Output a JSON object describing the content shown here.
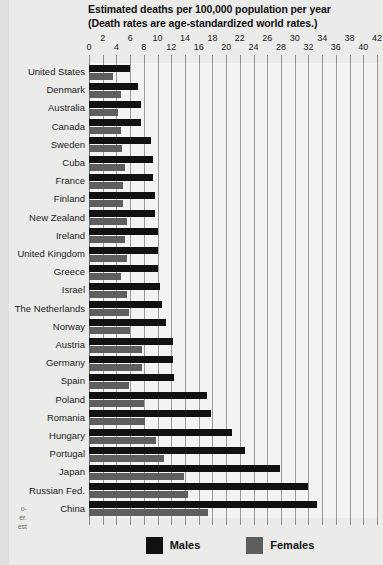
{
  "title": {
    "line1": "Estimated deaths per 100,000 population per year",
    "line2": "(Death rates are age-standardized world rates.)"
  },
  "legend": {
    "males_label": "Males",
    "females_label": "Females",
    "males_color": "#111111",
    "females_color": "#5e5e5e"
  },
  "bleed_text": {
    "l1": "o-",
    "l2": "er.",
    "l3": "est"
  },
  "chart_data": {
    "type": "bar",
    "orientation": "horizontal",
    "title": "Estimated deaths per 100,000 population per year (Death rates are age-standardized world rates.)",
    "xlabel": "",
    "ylabel": "",
    "xlim": [
      0,
      42
    ],
    "xticks": [
      0,
      2,
      4,
      6,
      8,
      10,
      12,
      14,
      16,
      18,
      20,
      22,
      24,
      26,
      28,
      30,
      32,
      34,
      36,
      38,
      40,
      42
    ],
    "xtick_labels": [
      "0",
      "2",
      "4",
      "6",
      "8",
      "10",
      "12",
      "14",
      "16",
      "18",
      "20",
      "22",
      "24",
      "26",
      "28",
      "30",
      "32",
      "34",
      "36",
      "38",
      "40",
      "42"
    ],
    "grid": true,
    "grid_axis": "x",
    "legend_position": "bottom",
    "categories": [
      "United States",
      "Denmark",
      "Australia",
      "Canada",
      "Sweden",
      "Cuba",
      "France",
      "Finland",
      "New Zealand",
      "Ireland",
      "United Kingdom",
      "Greece",
      "Israel",
      "The Netherlands",
      "Norway",
      "Austria",
      "Germany",
      "Spain",
      "Poland",
      "Romania",
      "Hungary",
      "Portugal",
      "Japan",
      "Russian Fed.",
      "China"
    ],
    "series": [
      {
        "name": "Males",
        "color": "#111111",
        "values": [
          6.0,
          7.2,
          7.6,
          7.6,
          9.0,
          9.3,
          9.4,
          9.6,
          9.6,
          10.0,
          10.1,
          10.1,
          10.3,
          10.6,
          11.2,
          12.2,
          12.2,
          12.4,
          17.2,
          17.8,
          20.8,
          22.8,
          27.8,
          32.0,
          33.2
        ]
      },
      {
        "name": "Females",
        "color": "#5e5e5e",
        "values": [
          3.5,
          4.6,
          4.2,
          4.6,
          4.8,
          5.2,
          5.0,
          5.0,
          5.6,
          5.2,
          5.6,
          4.6,
          5.6,
          5.8,
          6.0,
          7.8,
          7.8,
          5.8,
          8.0,
          8.2,
          9.8,
          11.0,
          13.8,
          14.5,
          17.4
        ]
      }
    ]
  }
}
